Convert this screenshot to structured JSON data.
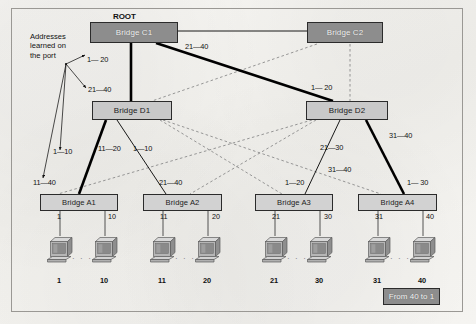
{
  "figure": {
    "root_label": "ROOT",
    "annotation": "Addresses\nlearned on\nthe port",
    "annotation_lines": [
      "Addresses",
      "learned on",
      "the port"
    ],
    "legend_label": "From 40 to 1",
    "colors": {
      "root_bridge_fill": "#8d8d8d",
      "distribution_bridge_fill": "#c9c9c9",
      "access_bridge_fill": "#d2d2d2",
      "legend_fill": "#8d8d8d",
      "forwarding_link": "#000000",
      "blocked_link": "#8b8b8b",
      "page_background": "#f4f3f0",
      "frame_border": "#9a9894"
    }
  },
  "bridges": {
    "core": [
      {
        "id": "c1",
        "label": "Bridge C1",
        "tier": "core",
        "is_root": true,
        "x": 90,
        "y": 22,
        "w": 88,
        "h": 21
      },
      {
        "id": "c2",
        "label": "Bridge C2",
        "tier": "core",
        "is_root": false,
        "x": 307,
        "y": 22,
        "w": 76,
        "h": 21
      }
    ],
    "distribution": [
      {
        "id": "d1",
        "label": "Bridge D1",
        "tier": "distribution",
        "x": 92,
        "y": 101,
        "w": 80,
        "h": 19
      },
      {
        "id": "d2",
        "label": "Bridge D2",
        "tier": "distribution",
        "x": 306,
        "y": 101,
        "w": 82,
        "h": 19
      }
    ],
    "access": [
      {
        "id": "a1",
        "label": "Bridge A1",
        "tier": "access",
        "x": 40,
        "y": 194,
        "w": 78,
        "h": 17
      },
      {
        "id": "a2",
        "label": "Bridge A2",
        "tier": "access",
        "x": 143,
        "y": 194,
        "w": 79,
        "h": 17
      },
      {
        "id": "a3",
        "label": "Bridge A3",
        "tier": "access",
        "x": 255,
        "y": 194,
        "w": 78,
        "h": 17
      },
      {
        "id": "a4",
        "label": "Bridge A4",
        "tier": "access",
        "x": 358,
        "y": 194,
        "w": 79,
        "h": 17
      }
    ]
  },
  "links": {
    "forwarding": [
      {
        "from": "c1",
        "to": "c2",
        "style": "thin",
        "x1": 178,
        "y1": 31,
        "x2": 307,
        "y2": 31
      },
      {
        "from": "c1",
        "to": "d1",
        "style": "thick",
        "x1": 131,
        "y1": 43,
        "x2": 131,
        "y2": 101
      },
      {
        "from": "c1",
        "to": "d2",
        "style": "thick",
        "x1": 156,
        "y1": 43,
        "x2": 333,
        "y2": 101
      },
      {
        "from": "d1",
        "to": "a1",
        "style": "thick",
        "x1": 106,
        "y1": 120,
        "x2": 79,
        "y2": 194
      },
      {
        "from": "d1",
        "to": "a2",
        "style": "thin",
        "x1": 117,
        "y1": 120,
        "x2": 166,
        "y2": 194
      },
      {
        "from": "d2",
        "to": "a3",
        "style": "thin",
        "x1": 340,
        "y1": 120,
        "x2": 305,
        "y2": 194
      },
      {
        "from": "d2",
        "to": "a4",
        "style": "thick",
        "x1": 366,
        "y1": 120,
        "x2": 404,
        "y2": 194
      }
    ],
    "blocked": [
      {
        "from": "c2",
        "to": "d1",
        "x1": 317,
        "y1": 44,
        "x2": 152,
        "y2": 101
      },
      {
        "from": "c2",
        "to": "d2",
        "x1": 350,
        "y1": 44,
        "x2": 350,
        "y2": 101
      },
      {
        "from": "d1",
        "to": "a3",
        "x1": 160,
        "y1": 120,
        "x2": 282,
        "y2": 194
      },
      {
        "from": "d1",
        "to": "a4",
        "x1": 163,
        "y1": 120,
        "x2": 381,
        "y2": 194
      },
      {
        "from": "d2",
        "to": "a1",
        "x1": 312,
        "y1": 120,
        "x2": 58,
        "y2": 194
      },
      {
        "from": "d2",
        "to": "a2",
        "x1": 316,
        "y1": 120,
        "x2": 190,
        "y2": 194
      }
    ]
  },
  "link_labels": [
    {
      "id": "c1-c2",
      "text": "21—40",
      "x": 185,
      "y": 42
    },
    {
      "id": "c1-d2",
      "text": "1— 20",
      "x": 311,
      "y": 83
    },
    {
      "id": "d1-a1",
      "text": "11—20",
      "x": 98,
      "y": 144
    },
    {
      "id": "d1-a2",
      "text": "1—10",
      "x": 133,
      "y": 144
    },
    {
      "id": "d1-left",
      "text": "1—10",
      "x": 53,
      "y": 147
    },
    {
      "id": "a1-top",
      "text": "11—40",
      "x": 33,
      "y": 178
    },
    {
      "id": "a2-top",
      "text": "21—40",
      "x": 159,
      "y": 178
    },
    {
      "id": "d2-a3",
      "text": "21—30",
      "x": 320,
      "y": 143
    },
    {
      "id": "d2-a4",
      "text": "31—40",
      "x": 389,
      "y": 131
    },
    {
      "id": "a3-top2",
      "text": "31—40",
      "x": 328,
      "y": 165
    },
    {
      "id": "a3-top",
      "text": "1—20",
      "x": 285,
      "y": 178
    },
    {
      "id": "a4-top",
      "text": "1— 30",
      "x": 407,
      "y": 178
    }
  ],
  "annotation_arrow_labels": [
    {
      "id": "ann-1-20",
      "text": "1— 20",
      "x": 87,
      "y": 55
    },
    {
      "id": "ann-21-40",
      "text": "21—40",
      "x": 88,
      "y": 85
    }
  ],
  "access_ports": [
    {
      "bridge": "a1",
      "port": "1",
      "x": 57,
      "y": 214,
      "drop_x": 60,
      "host_label": "1",
      "host_x": 47,
      "host_y": 276
    },
    {
      "bridge": "a1",
      "port": "10",
      "x": 108,
      "y": 214,
      "drop_x": 105,
      "host_label": "10",
      "host_x": 92,
      "host_y": 276
    },
    {
      "bridge": "a2",
      "port": "11",
      "x": 160,
      "y": 214,
      "drop_x": 163,
      "host_label": "11",
      "host_x": 150,
      "host_y": 276
    },
    {
      "bridge": "a2",
      "port": "20",
      "x": 212,
      "y": 214,
      "drop_x": 208,
      "host_label": "20",
      "host_x": 195,
      "host_y": 276
    },
    {
      "bridge": "a3",
      "port": "21",
      "x": 272,
      "y": 214,
      "drop_x": 275,
      "host_label": "21",
      "host_x": 262,
      "host_y": 276
    },
    {
      "bridge": "a3",
      "port": "30",
      "x": 324,
      "y": 214,
      "drop_x": 320,
      "host_label": "30",
      "host_x": 307,
      "host_y": 276
    },
    {
      "bridge": "a4",
      "port": "31",
      "x": 375,
      "y": 214,
      "drop_x": 378,
      "host_label": "31",
      "host_x": 365,
      "host_y": 276
    },
    {
      "bridge": "a4",
      "port": "40",
      "x": 426,
      "y": 214,
      "drop_x": 423,
      "host_label": "40",
      "host_x": 410,
      "host_y": 276
    }
  ],
  "ellipses": [
    {
      "x": 72,
      "y": 254
    },
    {
      "x": 175,
      "y": 254
    },
    {
      "x": 287,
      "y": 254
    },
    {
      "x": 390,
      "y": 254
    }
  ],
  "legend": {
    "x": 383,
    "y": 288,
    "w": 57,
    "h": 17
  }
}
